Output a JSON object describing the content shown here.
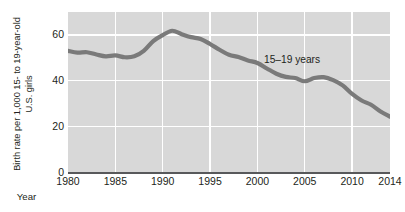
{
  "chart_data": {
    "type": "line",
    "title": "",
    "xlabel": "Year",
    "ylabel": "Birth rate per 1,000 15- to 19-year-old U.S. girls",
    "ylabel_lines": [
      "Birth rate per 1,000 15- to 19-year-old",
      "U.S. girls"
    ],
    "xlim": [
      1980,
      2014
    ],
    "ylim": [
      0,
      70
    ],
    "ytick_values": [
      0,
      20,
      40,
      60
    ],
    "ytick_labels": [
      "0",
      "20",
      "40",
      "60"
    ],
    "xtick_values": [
      1980,
      1985,
      1990,
      1995,
      2000,
      2005,
      2010,
      2014
    ],
    "xtick_labels": [
      "1980",
      "1985",
      "1990",
      "1995",
      "2000",
      "2005",
      "2010",
      "2014"
    ],
    "grid": "white gridlines on gray panel, horizontal at 20/40/60 and vertical at each x tick",
    "legend": "inline annotation at upper right of plot",
    "annotations": [
      {
        "text": "15–19 years",
        "x": 2001.5,
        "y": 47
      }
    ],
    "colors": {
      "line": "#7a7a7a",
      "panel_background": "#d8d8d8",
      "gridline": "#ffffff",
      "axis": "#58595b",
      "text": "#231f20",
      "figure_background": "#ffffff"
    },
    "series": [
      {
        "name": "15–19 years",
        "x": [
          1980,
          1981,
          1982,
          1983,
          1984,
          1985,
          1986,
          1987,
          1988,
          1989,
          1990,
          1991,
          1992,
          1993,
          1994,
          1995,
          1996,
          1997,
          1998,
          1999,
          2000,
          2001,
          2002,
          2003,
          2004,
          2005,
          2006,
          2007,
          2008,
          2009,
          2010,
          2011,
          2012,
          2013,
          2014
        ],
        "values": [
          53.0,
          52.2,
          52.4,
          51.4,
          50.6,
          51.0,
          50.2,
          50.6,
          53.0,
          57.3,
          59.9,
          61.8,
          60.3,
          59.0,
          58.2,
          56.0,
          53.5,
          51.3,
          50.3,
          48.8,
          47.7,
          45.3,
          43.0,
          41.6,
          41.1,
          39.7,
          41.1,
          41.5,
          40.2,
          37.9,
          34.2,
          31.3,
          29.4,
          26.5,
          24.2
        ]
      }
    ],
    "key_points": {
      "start_1980": 53.0,
      "local_min_1986": 50.2,
      "peak_1991": 61.8,
      "local_min_2005": 39.7,
      "local_max_2007": 41.5,
      "end_2014": 24.2
    }
  }
}
